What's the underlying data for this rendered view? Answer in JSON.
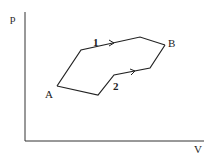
{
  "diagram": {
    "type": "pV diagram",
    "axes": {
      "y_label": "p",
      "x_label": "V"
    },
    "points": {
      "start": "A",
      "end": "B"
    },
    "paths": [
      {
        "label": "1",
        "description": "upper path from A to B"
      },
      {
        "label": "2",
        "description": "lower path from A to B"
      }
    ],
    "colors": {
      "line": "#222222",
      "background": "#ffffff"
    }
  }
}
